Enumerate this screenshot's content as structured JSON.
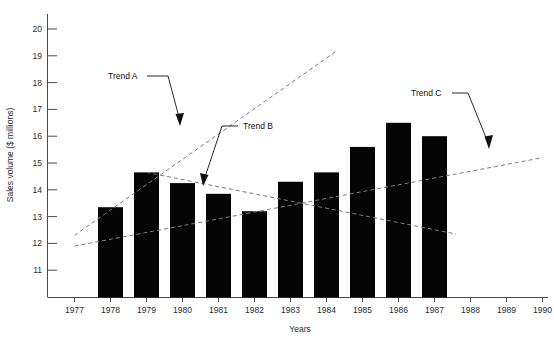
{
  "chart_data": {
    "type": "bar",
    "title": "",
    "xlabel": "Years",
    "ylabel": "Sales volume ($ millions)",
    "categories": [
      "1977",
      "1978",
      "1979",
      "1980",
      "1981",
      "1982",
      "1983",
      "1984",
      "1985",
      "1986",
      "1987",
      "1988",
      "1989",
      "1990"
    ],
    "values": [
      12.3,
      13.35,
      14.65,
      14.25,
      13.85,
      13.2,
      14.3,
      14.65,
      15.6,
      16.5,
      16.0,
      null,
      null,
      null
    ],
    "ylim": [
      10.5,
      20.4
    ],
    "yticks": [
      11,
      12,
      13,
      14,
      15,
      16,
      17,
      18,
      19,
      20
    ],
    "ytick_labels": [
      "11",
      "12",
      "13",
      "14",
      "15",
      "16",
      "17",
      "18",
      "19",
      "20"
    ],
    "grid": false,
    "legend": "none",
    "bar_color": "#050505",
    "trend_color": "#7b7b7b",
    "annotations": [
      {
        "label": "Trend A",
        "kind": "trend-line",
        "x_start": 1977,
        "y_start": 12.3,
        "x_end": 1984.3,
        "y_end": 19.2,
        "note": "rising dashed trend through 1977-1979 peak"
      },
      {
        "label": "Trend B",
        "kind": "trend-line",
        "x_start": 1979,
        "y_start": 14.65,
        "x_end": 1987.6,
        "y_end": 12.35,
        "note": "declining dashed trend from the 1979 peak"
      },
      {
        "label": "Trend C",
        "kind": "trend-line",
        "x_start": 1977,
        "y_start": 11.9,
        "x_end": 1990,
        "y_end": 15.2,
        "note": "long-run rising dashed trend"
      }
    ],
    "series_note": "Bars plotted only for 1977 through 1987; 1988-1990 are axis labels with no data."
  },
  "axes": {
    "y_title": "Sales volume ($ millions)",
    "x_title": "Years"
  },
  "labels": {
    "trend_a": "Trend A",
    "trend_b": "Trend B",
    "trend_c": "Trend C"
  }
}
